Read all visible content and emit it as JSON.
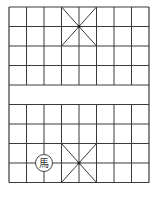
{
  "game": "xiangqi",
  "board": {
    "columns": 9,
    "rows": 10,
    "origin_x": 9,
    "origin_y": 7,
    "cell_w": 17.5,
    "cell_h": 19.5,
    "line_color": "#3a3a3a",
    "background": "#ffffff",
    "river_between_rows": [
      4,
      5
    ],
    "palaces": [
      {
        "name": "top-palace",
        "col_start": 3,
        "col_end": 5,
        "row_start": 0,
        "row_end": 2
      },
      {
        "name": "bottom-palace",
        "col_start": 3,
        "col_end": 5,
        "row_start": 7,
        "row_end": 9
      }
    ]
  },
  "pieces": [
    {
      "id": "horse",
      "label": "馬",
      "col": 2,
      "row": 8,
      "fill": "#ffffff",
      "stroke": "#444444"
    }
  ]
}
